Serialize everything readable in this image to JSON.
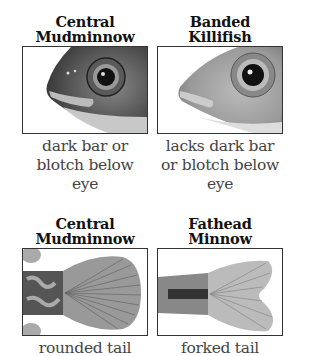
{
  "panels": [
    {
      "title_line1": "Central",
      "title_line2": "Mudminnow",
      "caption_lines": [
        "dark bar or",
        "blotch below",
        "eye"
      ],
      "image": "mudminnow-head-illustration"
    },
    {
      "title_line1": "Banded",
      "title_line2": "Killifish",
      "caption_lines": [
        "lacks dark bar",
        "or blotch below",
        "eye"
      ],
      "image": "killifish-head-illustration"
    },
    {
      "title_line1": "Central",
      "title_line2": "Mudminnow",
      "caption_lines": [
        "rounded tail"
      ],
      "image": "mudminnow-tail-illustration"
    },
    {
      "title_line1": "Fathead",
      "title_line2": "Minnow",
      "caption_lines": [
        "forked tail"
      ],
      "image": "fathead-tail-illustration"
    }
  ],
  "colors": {
    "border": "#333333",
    "title": "#111111",
    "caption": "#444444"
  }
}
